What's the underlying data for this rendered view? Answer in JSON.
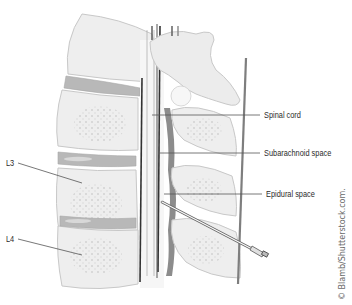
{
  "diagram": {
    "type": "anatomical-illustration",
    "labels": [
      {
        "id": "spinal-cord",
        "text": "Spinal cord",
        "x": 264,
        "y": 112
      },
      {
        "id": "subarachnoid-space",
        "text": "Subarachnoid space",
        "x": 264,
        "y": 150
      },
      {
        "id": "epidural-space",
        "text": "Epidural space",
        "x": 266,
        "y": 190
      },
      {
        "id": "l3",
        "text": "L3",
        "x": 6,
        "y": 160
      },
      {
        "id": "l4",
        "text": "L4",
        "x": 6,
        "y": 236
      }
    ],
    "credit": "© Blamb/Shutterstock.com.",
    "colors": {
      "bone": "#ececec",
      "bone_outline": "#c8c8c8",
      "disc": "#b4b4b4",
      "ligament": "#8c8c8c",
      "cord_line": "#3a3a3a",
      "leader_line": "#555555",
      "text": "#2b2b2b"
    }
  }
}
